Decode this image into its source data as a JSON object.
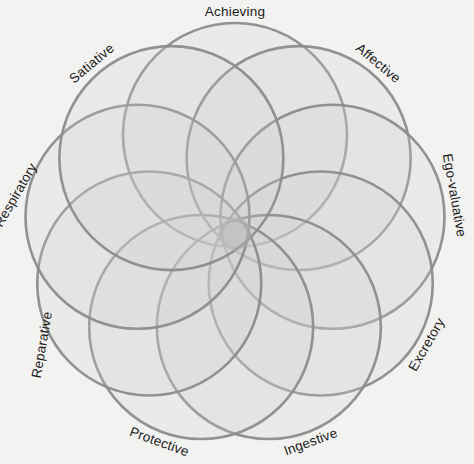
{
  "figure": {
    "name": "nine-circle-rosette",
    "background_color": "#fdfdfd",
    "stroke_color": "#8c8c8c",
    "fill_color": "#cfcfcf",
    "core_color": "#b4b4b4",
    "label_color": "#1b1b1b"
  },
  "geometry": {
    "center_x": 235,
    "center_y": 234,
    "circle_count": 9,
    "circle_radius": 112,
    "center_offset": 99,
    "outer_radius": 211,
    "core_radius": 17,
    "start_angle_deg": -90
  },
  "labels": [
    {
      "text": "Achieving",
      "angle_deg": -90,
      "rotation_deg": 0,
      "radius": 222
    },
    {
      "text": "Affective",
      "angle_deg": -50,
      "rotation_deg": 40,
      "radius": 222
    },
    {
      "text": "Ego-valuative",
      "angle_deg": -10,
      "rotation_deg": 80,
      "radius": 222
    },
    {
      "text": "Excretory",
      "angle_deg": 30,
      "rotation_deg": -60,
      "radius": 222
    },
    {
      "text": "Ingestive",
      "angle_deg": 70,
      "rotation_deg": -20,
      "radius": 222
    },
    {
      "text": "Protective",
      "angle_deg": 110,
      "rotation_deg": 20,
      "radius": 222
    },
    {
      "text": "Reparative",
      "angle_deg": 150,
      "rotation_deg": -80,
      "radius": 222
    },
    {
      "text": "Respiratory",
      "angle_deg": 190,
      "rotation_deg": -60,
      "radius": 222
    },
    {
      "text": "Satiative",
      "angle_deg": 230,
      "rotation_deg": -40,
      "radius": 222
    }
  ],
  "chart_data": {
    "type": "diagram",
    "subtype": "venn-rosette",
    "categories": [
      "Achieving",
      "Affective",
      "Ego-valuative",
      "Excretory",
      "Ingestive",
      "Protective",
      "Reparative",
      "Respiratory",
      "Satiative"
    ],
    "values": [
      1,
      1,
      1,
      1,
      1,
      1,
      1,
      1,
      1
    ],
    "legend_position": "around-perimeter",
    "grid": false,
    "xlabel": "",
    "ylabel": ""
  }
}
